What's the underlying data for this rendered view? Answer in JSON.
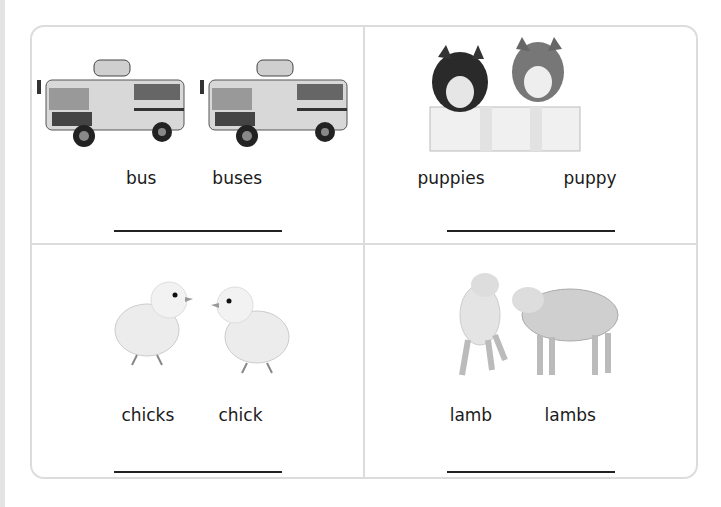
{
  "worksheet": {
    "cells": [
      {
        "image": "two-school-buses",
        "words": [
          "bus",
          "buses"
        ]
      },
      {
        "image": "two-husky-puppies-in-basket",
        "words": [
          "puppies",
          "puppy"
        ]
      },
      {
        "image": "two-chicks",
        "words": [
          "chicks",
          "chick"
        ]
      },
      {
        "image": "two-lambs",
        "words": [
          "lamb",
          "lambs"
        ]
      }
    ]
  }
}
